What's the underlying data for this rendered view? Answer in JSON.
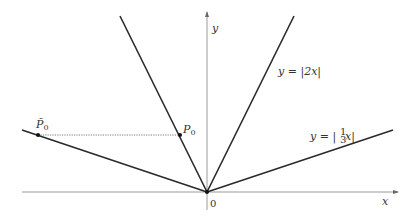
{
  "diagram": {
    "axes": {
      "x_label": "x",
      "y_label": "y",
      "origin_label": "0"
    },
    "curves": [
      {
        "name": "y = |2x|",
        "label": "y = |2x|"
      },
      {
        "name": "y = |(1/3)x|",
        "label_prefix": "y = |",
        "label_frac": "1/3",
        "label_suffix": "x|"
      }
    ],
    "points": [
      {
        "name": "P0",
        "label": "P",
        "subscript": "0"
      },
      {
        "name": "P0-tilde",
        "label": "P̃",
        "subscript": "0"
      }
    ],
    "colors": {
      "line": "#2a2a2a",
      "axis": "#8a8a8a",
      "dotted": "#555555"
    }
  }
}
